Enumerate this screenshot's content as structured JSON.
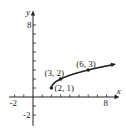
{
  "chart_data": {
    "type": "line",
    "title": "",
    "function": "y = sqrt(x - 2) + 1",
    "xlabel": "x",
    "ylabel": "y",
    "xlim": [
      -2.6,
      9
    ],
    "ylim": [
      -3,
      9
    ],
    "x_tick_labels": [
      "-2",
      "8"
    ],
    "y_tick_labels": [
      "8",
      "-2"
    ],
    "grid": false,
    "series": [
      {
        "name": "curve",
        "x": [
          2,
          2.25,
          3,
          4,
          5,
          6,
          7,
          8,
          8.6
        ],
        "y": [
          1,
          1.5,
          2,
          2.414,
          2.732,
          3,
          3.236,
          3.449,
          3.57
        ]
      }
    ],
    "points": [
      {
        "label": "(2, 1)",
        "x": 2,
        "y": 1
      },
      {
        "label": "(3, 2)",
        "x": 3,
        "y": 2
      },
      {
        "label": "(6, 3)",
        "x": 6,
        "y": 3
      }
    ]
  }
}
